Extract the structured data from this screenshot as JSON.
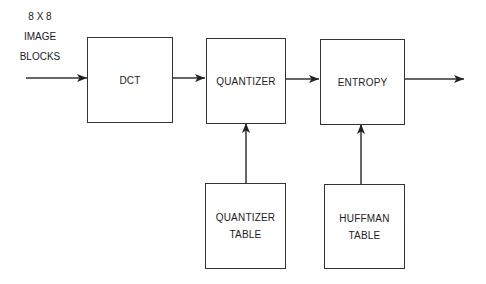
{
  "diagram": {
    "input_label": [
      "8 X 8",
      "IMAGE",
      "BLOCKS"
    ],
    "blocks": [
      {
        "id": "dct",
        "lines": [
          "DCT"
        ]
      },
      {
        "id": "quantizer",
        "lines": [
          "QUANTIZER"
        ]
      },
      {
        "id": "entropy",
        "lines": [
          "ENTROPY"
        ]
      },
      {
        "id": "quantizer-table",
        "lines": [
          "QUANTIZER",
          "TABLE"
        ]
      },
      {
        "id": "huffman-table",
        "lines": [
          "HUFFMAN",
          "TABLE"
        ]
      }
    ],
    "edges": [
      {
        "from": "input",
        "to": "dct"
      },
      {
        "from": "dct",
        "to": "quantizer"
      },
      {
        "from": "quantizer",
        "to": "entropy"
      },
      {
        "from": "entropy",
        "to": "output"
      },
      {
        "from": "quantizer-table",
        "to": "quantizer"
      },
      {
        "from": "huffman-table",
        "to": "entropy"
      }
    ],
    "line_color": "#333333"
  }
}
